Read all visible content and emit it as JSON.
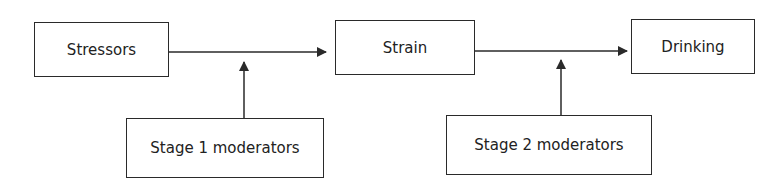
{
  "diagram": {
    "nodes": {
      "stressors": {
        "label": "Stressors"
      },
      "strain": {
        "label": "Strain"
      },
      "drinking": {
        "label": "Drinking"
      },
      "stage1": {
        "label": "Stage 1 moderators"
      },
      "stage2": {
        "label": "Stage 2 moderators"
      }
    },
    "edges": [
      {
        "from": "Stressors",
        "to": "Strain"
      },
      {
        "from": "Strain",
        "to": "Drinking"
      },
      {
        "from": "Stage 1 moderators",
        "to": "Stressors→Strain path"
      },
      {
        "from": "Stage 2 moderators",
        "to": "Strain→Drinking path"
      }
    ],
    "colors": {
      "line": "#2a2a2a",
      "background": "#ffffff"
    }
  }
}
